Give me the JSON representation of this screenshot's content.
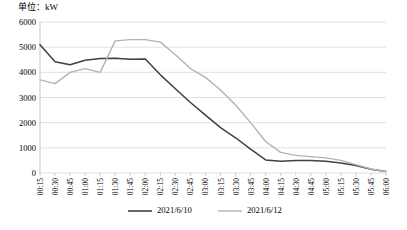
{
  "chart_data": {
    "type": "line",
    "title": "单位：kW",
    "xlabel": "",
    "ylabel": "",
    "ylim": [
      0,
      6000
    ],
    "ytick_step": 1000,
    "yticks": [
      0,
      1000,
      2000,
      3000,
      4000,
      5000,
      6000
    ],
    "grid": true,
    "legend_position": "bottom",
    "categories": [
      "00:15",
      "00:30",
      "00:45",
      "01:00",
      "01:15",
      "01:30",
      "01:45",
      "02:00",
      "02:15",
      "02:30",
      "02:45",
      "03:00",
      "03:15",
      "03:30",
      "03:45",
      "04:00",
      "04:15",
      "04:30",
      "04:45",
      "05:00",
      "05:15",
      "05:30",
      "05:45",
      "06:00"
    ],
    "series": [
      {
        "name": "2021/6/10",
        "color": "#404040",
        "values": [
          5100,
          4420,
          4300,
          4480,
          4550,
          4560,
          4520,
          4530,
          3900,
          3350,
          2800,
          2300,
          1800,
          1400,
          950,
          520,
          470,
          500,
          500,
          470,
          400,
          300,
          150,
          60
        ]
      },
      {
        "name": "2021/6/12",
        "color": "#b3b3b3",
        "values": [
          3700,
          3550,
          4000,
          4150,
          4000,
          5250,
          5300,
          5300,
          5200,
          4700,
          4150,
          3800,
          3300,
          2700,
          2000,
          1250,
          820,
          700,
          650,
          600,
          500,
          330,
          160,
          60
        ]
      }
    ]
  },
  "legend": {
    "items": [
      {
        "label": "2021/6/10",
        "color": "#404040"
      },
      {
        "label": "2021/6/12",
        "color": "#b3b3b3"
      }
    ]
  },
  "axis_colors": {
    "grid": "#d9d9d9",
    "axis": "#bfbfbf"
  }
}
